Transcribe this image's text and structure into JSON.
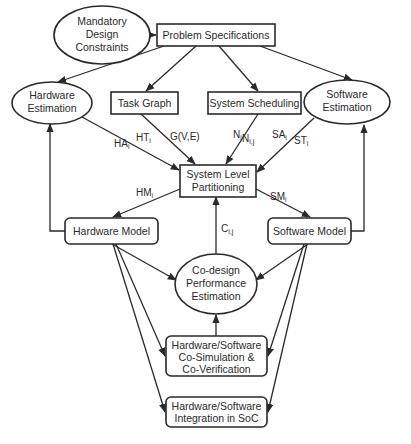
{
  "diagram": {
    "title": "",
    "nodes": {
      "mandatory": {
        "lines": [
          "Mandatory",
          "Design",
          "Constraints"
        ],
        "shape": "ellipse"
      },
      "problem": {
        "lines": [
          "Problem Specifications"
        ],
        "shape": "rect"
      },
      "hw_est": {
        "lines": [
          "Hardware",
          "Estimation"
        ],
        "shape": "ellipse"
      },
      "task_graph": {
        "lines": [
          "Task Graph"
        ],
        "shape": "rect"
      },
      "sys_sched": {
        "lines": [
          "System Scheduling"
        ],
        "shape": "rect"
      },
      "sw_est": {
        "lines": [
          "Software",
          "Estimation"
        ],
        "shape": "ellipse"
      },
      "partition": {
        "lines": [
          "System Level",
          "Partitioning"
        ],
        "shape": "rect"
      },
      "hw_model": {
        "lines": [
          "Hardware Model"
        ],
        "shape": "rounded-rect"
      },
      "sw_model": {
        "lines": [
          "Software Model"
        ],
        "shape": "rounded-rect"
      },
      "codesign": {
        "lines": [
          "Co-design",
          "Performance",
          "Estimation"
        ],
        "shape": "ellipse"
      },
      "cosim": {
        "lines": [
          "Hardware/Software",
          "Co-Simulation &",
          "Co-Verification"
        ],
        "shape": "rounded-rect"
      },
      "integration": {
        "lines": [
          "Hardware/Software",
          "Integration in SoC"
        ],
        "shape": "rounded-rect"
      }
    },
    "edge_labels": {
      "ha": {
        "base": "HA",
        "sub": "i"
      },
      "ht": {
        "base": "HT",
        "sub": "i"
      },
      "g": {
        "base": "G(V,E)",
        "sub": ""
      },
      "n": {
        "base": "N",
        "sub": "i"
      },
      "nij": {
        "base": "N",
        "sub": "i,j"
      },
      "sa": {
        "base": "SA",
        "sub": "i"
      },
      "st": {
        "base": "ST",
        "sub": "i"
      },
      "hm": {
        "base": "HM",
        "sub": "i"
      },
      "sm": {
        "base": "SM",
        "sub": "i"
      },
      "c": {
        "base": "C",
        "sub": "i,j"
      }
    },
    "edges": [
      {
        "from": "mandatory",
        "to": "problem"
      },
      {
        "from": "problem",
        "to": "hw_est"
      },
      {
        "from": "problem",
        "to": "task_graph"
      },
      {
        "from": "problem",
        "to": "sys_sched"
      },
      {
        "from": "problem",
        "to": "sw_est"
      },
      {
        "from": "hw_est",
        "to": "partition",
        "labels": [
          "HAi",
          "HTi"
        ]
      },
      {
        "from": "task_graph",
        "to": "partition",
        "labels": [
          "G(V,E)"
        ]
      },
      {
        "from": "sys_sched",
        "to": "partition",
        "labels": [
          "Ni",
          "Ni,j"
        ]
      },
      {
        "from": "sw_est",
        "to": "partition",
        "labels": [
          "SAi",
          "STi"
        ]
      },
      {
        "from": "partition",
        "to": "hw_model",
        "labels": [
          "HMi"
        ]
      },
      {
        "from": "partition",
        "to": "sw_model",
        "labels": [
          "SMi"
        ]
      },
      {
        "from": "hw_model",
        "to": "hw_est"
      },
      {
        "from": "sw_model",
        "to": "sw_est"
      },
      {
        "from": "codesign",
        "to": "partition",
        "labels": [
          "Ci,j"
        ]
      },
      {
        "from": "hw_model",
        "to": "codesign"
      },
      {
        "from": "sw_model",
        "to": "codesign"
      },
      {
        "from": "hw_model",
        "to": "cosim"
      },
      {
        "from": "sw_model",
        "to": "cosim"
      },
      {
        "from": "hw_model",
        "to": "integration"
      },
      {
        "from": "sw_model",
        "to": "integration"
      },
      {
        "from": "cosim",
        "to": "codesign"
      }
    ],
    "colors": {
      "stroke": "#2a2a2a",
      "fill": "#ffffff",
      "text": "#2a2a2a"
    }
  }
}
